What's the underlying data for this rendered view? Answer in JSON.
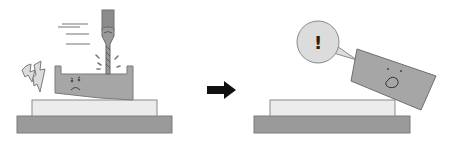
{
  "figure": {
    "panels": [
      {
        "name": "before",
        "description": "Drill cutting into workpiece held on fixture; workpiece vibrates with a worried face"
      },
      {
        "name": "after",
        "description": "Workpiece has flown off the fixture with a surprised face"
      }
    ],
    "arrow": {
      "direction": "right"
    },
    "speech_bubble": {
      "text": "!"
    },
    "colors": {
      "base": "#9a9a9a",
      "plate": "#ececec",
      "workpiece": "#a6a6a6",
      "drill": "#8c8c8c",
      "outline": "#777777",
      "bubble": "#dcdcdc",
      "arrow": "#111111",
      "lines": "#888888",
      "lightning": "#d8d8d8"
    }
  }
}
